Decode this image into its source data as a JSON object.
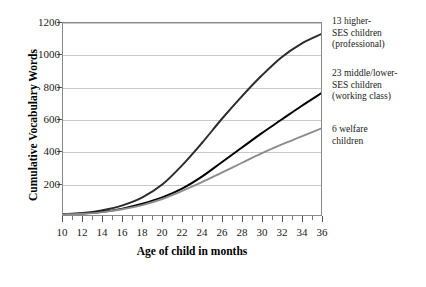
{
  "chart_data": {
    "type": "line",
    "title": "",
    "xlabel": "Age of child in months",
    "ylabel": "Cumulative Vocabulary Words",
    "xlim": [
      10,
      36
    ],
    "ylim": [
      0,
      1200
    ],
    "grid": true,
    "legend_position": "right-annotations",
    "x_ticks": [
      10,
      12,
      14,
      16,
      18,
      20,
      22,
      24,
      26,
      28,
      30,
      32,
      34,
      36
    ],
    "y_ticks": [
      200,
      400,
      600,
      800,
      1000,
      1200
    ],
    "x": [
      10,
      12,
      14,
      16,
      18,
      20,
      22,
      24,
      26,
      28,
      30,
      32,
      34,
      36
    ],
    "series": [
      {
        "name": "13 higher-SES children (professional)",
        "color": "#2b2b2b",
        "values": [
          5,
          12,
          30,
          60,
          110,
          190,
          310,
          450,
          600,
          740,
          870,
          985,
          1070,
          1130
        ]
      },
      {
        "name": "23 middle/lower-SES children (working class)",
        "color": "#000000",
        "values": [
          4,
          9,
          20,
          40,
          70,
          110,
          165,
          240,
          330,
          420,
          510,
          595,
          680,
          760
        ]
      },
      {
        "name": "6 welfare children",
        "color": "#8c8c8c",
        "values": [
          4,
          8,
          18,
          36,
          62,
          100,
          150,
          205,
          265,
          325,
          385,
          440,
          490,
          540
        ]
      }
    ]
  },
  "axes": {
    "y_title": "Cumulative Vocabulary Words",
    "x_title": "Age of child in months",
    "y_tick_labels": [
      "200",
      "400",
      "600",
      "800",
      "1000",
      "1200"
    ],
    "x_tick_labels": [
      "10",
      "12",
      "14",
      "16",
      "18",
      "20",
      "22",
      "24",
      "26",
      "28",
      "30",
      "32",
      "34",
      "36"
    ]
  },
  "annotations": [
    {
      "lines": [
        "13 higher-",
        "SES children",
        "(professional)"
      ]
    },
    {
      "lines": [
        "23 middle/lower-",
        "SES children",
        "(working class)"
      ]
    },
    {
      "lines": [
        "6 welfare",
        "children"
      ]
    }
  ]
}
